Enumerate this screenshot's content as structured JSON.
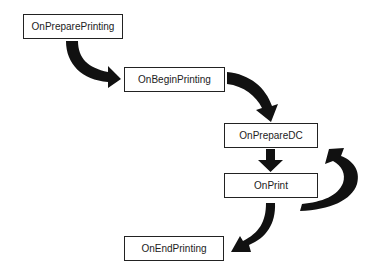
{
  "diagram": {
    "type": "flowchart",
    "nodes": [
      {
        "id": "prepare_printing",
        "label": "OnPreparePrinting"
      },
      {
        "id": "begin_printing",
        "label": "OnBeginPrinting"
      },
      {
        "id": "prepare_dc",
        "label": "OnPrepareDC"
      },
      {
        "id": "print",
        "label": "OnPrint"
      },
      {
        "id": "end_printing",
        "label": "OnEndPrinting"
      }
    ],
    "edges": [
      {
        "from": "prepare_printing",
        "to": "begin_printing"
      },
      {
        "from": "begin_printing",
        "to": "prepare_dc"
      },
      {
        "from": "prepare_dc",
        "to": "print"
      },
      {
        "from": "print",
        "to": "prepare_dc",
        "loop": true
      },
      {
        "from": "print",
        "to": "end_printing"
      }
    ],
    "colors": {
      "arrow": "#111111",
      "border": "#222222",
      "background": "#ffffff"
    }
  }
}
